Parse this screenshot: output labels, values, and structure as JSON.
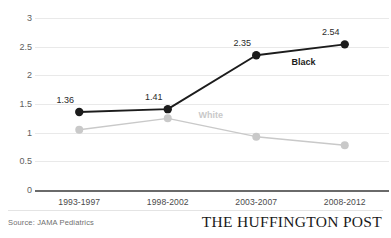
{
  "chart_data": {
    "type": "line",
    "title": "",
    "subtitle": "",
    "xlabel": "",
    "ylabel": "",
    "categories": [
      "1993-1997",
      "1998-2002",
      "2003-2007",
      "2008-2012"
    ],
    "series": [
      {
        "name": "Black",
        "color": "#1c1c1c",
        "values": [
          1.36,
          1.41,
          2.35,
          2.54
        ],
        "labels": [
          "1.36",
          "1.41",
          "2.35",
          "2.54"
        ],
        "show_labels": true
      },
      {
        "name": "White",
        "color": "#c9c9c9",
        "values": [
          1.05,
          1.25,
          0.93,
          0.78
        ],
        "labels": [
          "",
          "",
          "",
          ""
        ],
        "show_labels": false
      }
    ],
    "ylim": [
      0,
      3
    ],
    "yticks": [
      0,
      0.5,
      1,
      1.5,
      2,
      2.5,
      3
    ],
    "ytick_labels": [
      "0",
      "0.5",
      "1",
      "1.5",
      "2",
      "2.5",
      "3"
    ],
    "grid": true,
    "legend": "inline-series-labels"
  },
  "footer": {
    "source": "Source: JAMA Pediatrics",
    "brand": "THE HUFFINGTON POST"
  },
  "colors": {
    "black_series": "#1c1c1c",
    "white_series": "#c9c9c9",
    "gridline": "#e9e9e9",
    "axis": "#6a6a6a",
    "tick_text": "#5e5e5e"
  }
}
